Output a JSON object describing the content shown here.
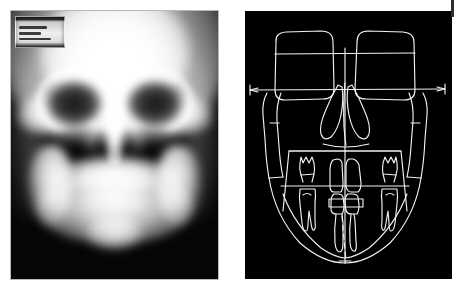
{
  "figure": {
    "type": "medical-imaging-figure",
    "panel_count": 2,
    "background_color": "#ffffff",
    "panels": [
      {
        "id": "radiograph",
        "name": "posteroanterior-cephalometric-radiograph",
        "modality": "radiograph",
        "view": "posteroanterior",
        "background_color": "#000000",
        "border_color": "#b8b8b8",
        "label_plate": {
          "present": true,
          "position": "top-left",
          "legible": false,
          "line1": "",
          "line2": "",
          "line3": ""
        },
        "anatomy": [
          "cranial-vault",
          "frontal-bone",
          "orbit-left",
          "orbit-right",
          "orbital-rim-left",
          "orbital-rim-right",
          "nasal-septum",
          "nasal-fossa-left",
          "nasal-fossa-right",
          "maxillary-sinus-left",
          "maxillary-sinus-right",
          "zygomatic-arch-left",
          "zygomatic-arch-right",
          "maxilla",
          "mandible-body",
          "mandibular-ramus-left",
          "mandibular-ramus-right",
          "symphysis"
        ]
      },
      {
        "id": "tracing",
        "name": "cephalometric-line-tracing",
        "background_color": "#000000",
        "line_color": "#f2f2f2",
        "structures": [
          "orbit-outline-left",
          "orbit-outline-right",
          "interorbital-horizontal-line",
          "horizontal-reference-line",
          "facial-midline-vertical",
          "nasal-cavity-left",
          "nasal-cavity-right",
          "nasal-septum-line",
          "maxillary-frame",
          "occlusal-plane-line",
          "upper-molar-left",
          "upper-molar-right",
          "lower-molar-left",
          "lower-molar-right",
          "upper-central-incisors",
          "lower-central-incisors",
          "mandibular-outline",
          "dental-midline-dashed",
          "menton-point",
          "condyle-left",
          "condyle-right"
        ],
        "reference_line_arrows": [
          "left-arrowhead",
          "right-arrowhead"
        ],
        "dental_midline_style": "dashed",
        "midline_style": "solid"
      }
    ],
    "corner_tick": {
      "present": true,
      "position": "top-right",
      "color": "#2e2e2e"
    }
  }
}
